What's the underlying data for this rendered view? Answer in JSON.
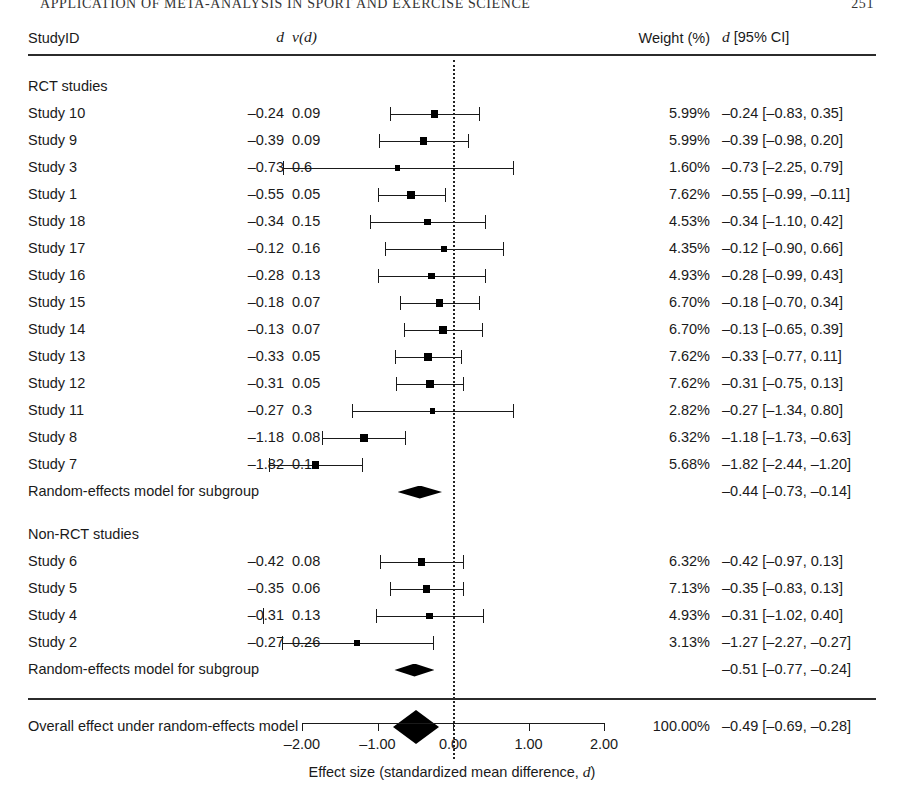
{
  "running_head": {
    "text": "APPLICATION OF META-ANALYSIS IN SPORT AND EXERCISE SCIENCE",
    "folio": "251"
  },
  "header": {
    "study_id": "StudyID",
    "d": "d",
    "vd_prefix": "v(",
    "vd_italic": "d",
    "vd_suffix": ")",
    "weight": "Weight (%)",
    "ci_d": "d",
    "ci_label": "[95% CI]"
  },
  "groups": [
    {
      "label": "RCT studies"
    },
    {
      "label": "Non-RCT studies"
    }
  ],
  "summary_label": "Random-effects model for subgroup",
  "overall_label": "Overall effect under random-effects model",
  "axis": {
    "ticks": [
      "-2.00",
      "-1.00",
      "0.00",
      "1.00",
      "2.00"
    ],
    "tick_values": [
      -2,
      -1,
      0,
      1,
      2
    ],
    "title": "Effect size (standardized mean difference, d)",
    "title_plain": "Effect size (standardized mean difference, ",
    "title_italic": "d",
    "title_end": ")"
  },
  "chart_data": {
    "type": "forest",
    "xlabel": "Effect size (standardized mean difference, d)",
    "xlim": [
      -2.6,
      2.2
    ],
    "xticks": [
      -2,
      -1,
      0,
      1,
      2
    ],
    "null_line": 0,
    "grid": false,
    "subgroups": [
      {
        "name": "RCT studies",
        "studies": [
          {
            "label": "Study 10",
            "d": "-0.24",
            "vd": "0.09",
            "weight": "5.99%",
            "ci_text": "-0.24 [-0.83,   0.35]",
            "est": -0.24,
            "lo": -0.83,
            "hi": 0.35,
            "w": 5.99
          },
          {
            "label": "Study 9",
            "d": "-0.39",
            "vd": "0.09",
            "weight": "5.99%",
            "ci_text": "-0.39 [-0.98,   0.20]",
            "est": -0.39,
            "lo": -0.98,
            "hi": 0.2,
            "w": 5.99
          },
          {
            "label": "Study 3",
            "d": "-0.73",
            "vd": "0.6",
            "weight": "1.60%",
            "ci_text": "-0.73 [-2.25,   0.79]",
            "est": -0.73,
            "lo": -2.25,
            "hi": 0.79,
            "w": 1.6
          },
          {
            "label": "Study 1",
            "d": "-0.55",
            "vd": "0.05",
            "weight": "7.62%",
            "ci_text": "-0.55 [-0.99, -0.11]",
            "est": -0.55,
            "lo": -0.99,
            "hi": -0.11,
            "w": 7.62
          },
          {
            "label": "Study 18",
            "d": "-0.34",
            "vd": "0.15",
            "weight": "4.53%",
            "ci_text": "-0.34 [-1.10,   0.42]",
            "est": -0.34,
            "lo": -1.1,
            "hi": 0.42,
            "w": 4.53
          },
          {
            "label": "Study 17",
            "d": "-0.12",
            "vd": "0.16",
            "weight": "4.35%",
            "ci_text": "-0.12 [-0.90,   0.66]",
            "est": -0.12,
            "lo": -0.9,
            "hi": 0.66,
            "w": 4.35
          },
          {
            "label": "Study 16",
            "d": "-0.28",
            "vd": "0.13",
            "weight": "4.93%",
            "ci_text": "-0.28 [-0.99,   0.43]",
            "est": -0.28,
            "lo": -0.99,
            "hi": 0.43,
            "w": 4.93
          },
          {
            "label": "Study 15",
            "d": "-0.18",
            "vd": "0.07",
            "weight": "6.70%",
            "ci_text": "-0.18 [-0.70,   0.34]",
            "est": -0.18,
            "lo": -0.7,
            "hi": 0.34,
            "w": 6.7
          },
          {
            "label": "Study 14",
            "d": "-0.13",
            "vd": "0.07",
            "weight": "6.70%",
            "ci_text": "-0.13 [-0.65,   0.39]",
            "est": -0.13,
            "lo": -0.65,
            "hi": 0.39,
            "w": 6.7
          },
          {
            "label": "Study 13",
            "d": "-0.33",
            "vd": "0.05",
            "weight": "7.62%",
            "ci_text": "-0.33 [-0.77,   0.11]",
            "est": -0.33,
            "lo": -0.77,
            "hi": 0.11,
            "w": 7.62
          },
          {
            "label": "Study 12",
            "d": "-0.31",
            "vd": "0.05",
            "weight": "7.62%",
            "ci_text": "-0.31 [-0.75,   0.13]",
            "est": -0.31,
            "lo": -0.75,
            "hi": 0.13,
            "w": 7.62
          },
          {
            "label": "Study 11",
            "d": "-0.27",
            "vd": "0.3",
            "weight": "2.82%",
            "ci_text": "-0.27 [-1.34,   0.80]",
            "est": -0.27,
            "lo": -1.34,
            "hi": 0.8,
            "w": 2.82
          },
          {
            "label": "Study 8",
            "d": "-1.18",
            "vd": "0.08",
            "weight": "6.32%",
            "ci_text": "-1.18 [-1.73, -0.63]",
            "est": -1.18,
            "lo": -1.73,
            "hi": -0.63,
            "w": 6.32
          },
          {
            "label": "Study 7",
            "d": "-1.82",
            "vd": "0.1",
            "weight": "5.68%",
            "ci_text": "-1.82 [-2.44, -1.20]",
            "est": -1.82,
            "lo": -2.44,
            "hi": -1.2,
            "w": 5.68
          }
        ],
        "summary": {
          "label": "Random-effects model for subgroup",
          "ci_text": "-0.44 [-0.73, -0.14]",
          "est": -0.44,
          "lo": -0.73,
          "hi": -0.14
        }
      },
      {
        "name": "Non-RCT studies",
        "studies": [
          {
            "label": "Study 6",
            "d": "-0.42",
            "vd": "0.08",
            "weight": "6.32%",
            "ci_text": "-0.42 [-0.97,   0.13]",
            "est": -0.42,
            "lo": -0.97,
            "hi": 0.13,
            "w": 6.32
          },
          {
            "label": "Study 5",
            "d": "-0.35",
            "vd": "0.06",
            "weight": "7.13%",
            "ci_text": "-0.35 [-0.83,   0.13]",
            "est": -0.35,
            "lo": -0.83,
            "hi": 0.13,
            "w": 7.13
          },
          {
            "label": "Study 4",
            "d": "-0.31",
            "vd": "0.13",
            "weight": "4.93%",
            "ci_text": "-0.31 [-1.02,   0.40]",
            "est": -0.31,
            "lo": -1.02,
            "hi": 0.4,
            "w": 4.93
          },
          {
            "label": "Study 2",
            "d": "-0.27",
            "vd": "0.26",
            "weight": "3.13%",
            "ci_text": "-1.27 [-2.27, -0.27]",
            "est": -1.27,
            "lo": -2.27,
            "hi": -0.27,
            "w": 3.13
          }
        ],
        "summary": {
          "label": "Random-effects model for subgroup",
          "ci_text": "-0.51 [-0.77, -0.24]",
          "est": -0.51,
          "lo": -0.77,
          "hi": -0.24
        }
      }
    ],
    "overall": {
      "label": "Overall effect under random-effects model",
      "weight": "100.00%",
      "ci_text": "-0.49 [-0.69, -0.28]",
      "est": -0.49,
      "lo": -0.69,
      "hi": -0.28
    }
  }
}
